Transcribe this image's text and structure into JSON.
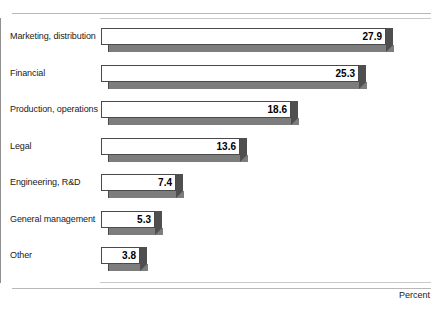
{
  "chart_data": {
    "type": "bar",
    "orientation": "horizontal",
    "title": "",
    "xlabel": "Percent",
    "ylabel": "",
    "categories": [
      "Marketing, distribution",
      "Financial",
      "Production, operations",
      "Legal",
      "Engineering, R&D",
      "General management",
      "Other"
    ],
    "values": [
      27.9,
      25.3,
      18.6,
      13.6,
      7.4,
      5.3,
      3.8
    ],
    "value_labels": [
      "27.9",
      "25.3",
      "18.6",
      "13.6",
      "7.4",
      "5.3",
      "3.8"
    ],
    "xlim": [
      0,
      32
    ],
    "grid": false,
    "legend": null,
    "style": {
      "bar_face_color": "#ffffff",
      "bar_edge_color": "#4a4a4a",
      "bar_shadow_color": "#7d7d7d",
      "bar_cap_color": "#4f4f4f",
      "rule_color": "#b8b8b8",
      "axis_color": "#8f8f8f"
    }
  },
  "axis": {
    "percent_label": "Percent"
  },
  "footnote": ""
}
